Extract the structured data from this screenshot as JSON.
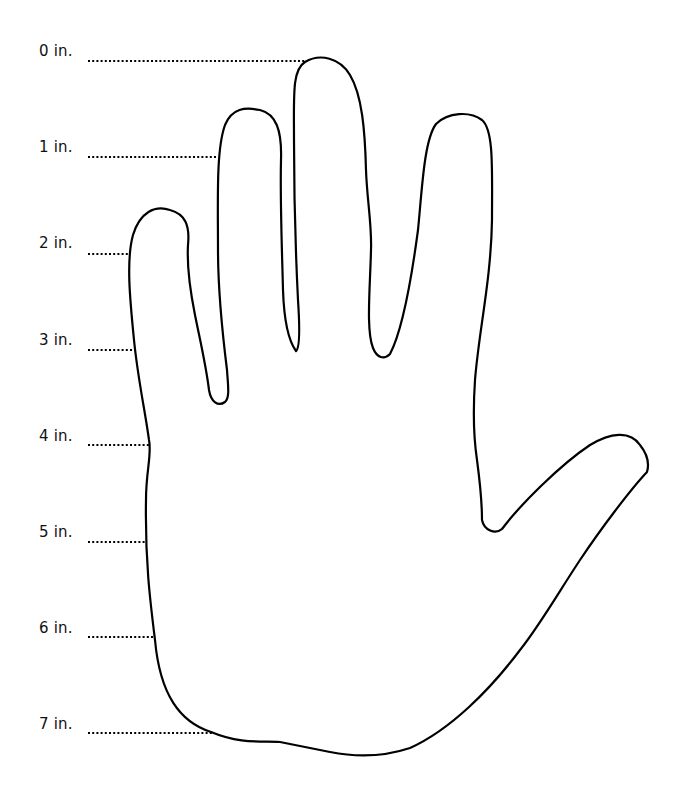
{
  "diagram": {
    "stroke_color": "#000000",
    "background": "#ffffff",
    "ruler_labels": [
      {
        "text": "0 in.",
        "y": 50
      },
      {
        "text": "1 in.",
        "y": 146
      },
      {
        "text": "2 in.",
        "y": 242
      },
      {
        "text": "3 in.",
        "y": 339
      },
      {
        "text": "4 in.",
        "y": 435
      },
      {
        "text": "5 in.",
        "y": 531
      },
      {
        "text": "6 in.",
        "y": 627
      },
      {
        "text": "7 in.",
        "y": 723
      }
    ]
  }
}
